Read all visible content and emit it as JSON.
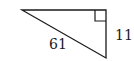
{
  "diagram": {
    "type": "right-triangle",
    "stroke_color": "#1a1a1a",
    "vertices": {
      "left": [
        22,
        10
      ],
      "right_angle": [
        106,
        10
      ],
      "bottom": [
        106,
        58
      ]
    },
    "right_angle_marker": true,
    "labels": {
      "hypotenuse": "61",
      "vertical_leg": "11"
    }
  }
}
